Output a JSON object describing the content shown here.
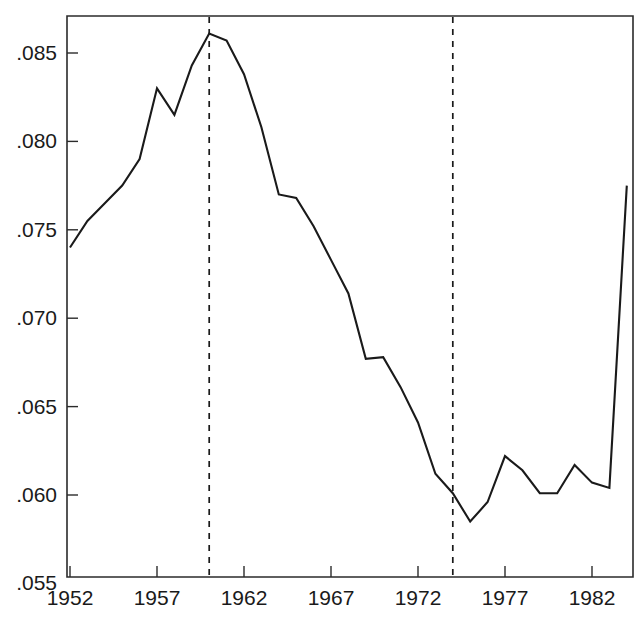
{
  "chart_data": {
    "type": "line",
    "title": "",
    "subtitle": "",
    "xlabel": "",
    "ylabel": "",
    "xlim": [
      1951.0,
      1984.5
    ],
    "ylim": [
      0.055,
      0.0875
    ],
    "grid": false,
    "legend": false,
    "legend_position": "none",
    "y_ticks": [
      0.055,
      0.06,
      0.065,
      0.07,
      0.075,
      0.08,
      0.085
    ],
    "y_tick_labels": [
      ".055",
      ".060",
      ".065",
      ".070",
      ".075",
      ".080",
      ".085"
    ],
    "x_ticks": [
      1952,
      1957,
      1962,
      1967,
      1972,
      1977,
      1982
    ],
    "x_tick_labels": [
      "1952",
      "1957",
      "1962",
      "1967",
      "1972",
      "1977",
      "1982"
    ],
    "annotations": [
      {
        "name": "vertical-dashed-line-1960",
        "type": "vline",
        "x": 1960,
        "style": "dashed"
      },
      {
        "name": "vertical-dashed-line-1974",
        "type": "vline",
        "x": 1974,
        "style": "dashed"
      }
    ],
    "series": [
      {
        "name": "series-1",
        "color": "#1a1a1a",
        "x": [
          1952,
          1953,
          1954,
          1955,
          1956,
          1957,
          1958,
          1959,
          1960,
          1961,
          1962,
          1963,
          1964,
          1965,
          1966,
          1967,
          1968,
          1969,
          1970,
          1971,
          1972,
          1973,
          1974,
          1975,
          1976,
          1977,
          1978,
          1979,
          1980,
          1981,
          1982,
          1983,
          1984
        ],
        "values": [
          0.074,
          0.0755,
          0.0765,
          0.0775,
          0.079,
          0.083,
          0.0815,
          0.0843,
          0.0861,
          0.0857,
          0.0838,
          0.0808,
          0.077,
          0.0768,
          0.0752,
          0.0733,
          0.0714,
          0.0677,
          0.0678,
          0.0661,
          0.0641,
          0.0612,
          0.0601,
          0.0585,
          0.0596,
          0.0622,
          0.0614,
          0.0601,
          0.0601,
          0.0617,
          0.0607,
          0.0604,
          0.0775
        ]
      }
    ]
  }
}
